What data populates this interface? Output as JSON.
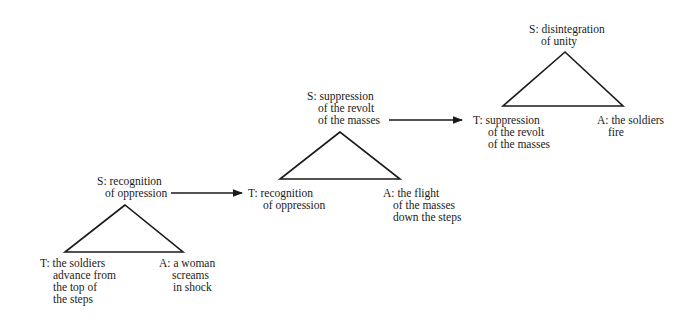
{
  "diagram": {
    "triangles": [
      {
        "id": "t1",
        "S": [
          "S: recognition",
          "of oppression"
        ],
        "T": [
          "T: the soldiers",
          "advance from",
          "the top of",
          "the steps"
        ],
        "A": [
          "A: a woman",
          "screams",
          "in shock"
        ]
      },
      {
        "id": "t2",
        "S": [
          "S: suppression",
          "of the revolt",
          "of the masses"
        ],
        "T": [
          "T: recognition",
          "of oppression"
        ],
        "A": [
          "A: the flight",
          "of the masses",
          "down the steps"
        ]
      },
      {
        "id": "t3",
        "S": [
          "S: disintegration",
          "of unity"
        ],
        "T": [
          "T: suppression",
          "of the revolt",
          "of the masses"
        ],
        "A": [
          "A: the soldiers",
          "fire"
        ]
      }
    ],
    "arrows": [
      {
        "from": "t1.S",
        "to": "t2.T"
      },
      {
        "from": "t2.S",
        "to": "t3.T"
      }
    ],
    "colors": {
      "stroke": "#1a1a1a",
      "background": "#ffffff"
    }
  }
}
